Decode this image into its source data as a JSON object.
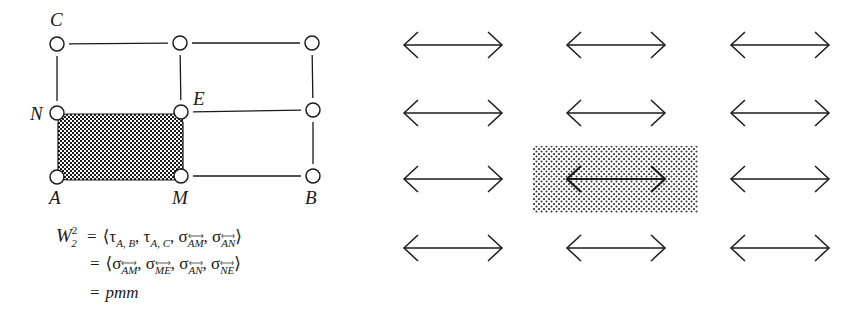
{
  "figure": {
    "left_diagram": {
      "nodes": [
        {
          "id": "C",
          "label": "C",
          "x": 57,
          "y": 44
        },
        {
          "id": "top-mid",
          "label": "",
          "x": 180,
          "y": 43
        },
        {
          "id": "top-right",
          "label": "",
          "x": 312,
          "y": 43
        },
        {
          "id": "N",
          "label": "N",
          "x": 57,
          "y": 113
        },
        {
          "id": "E",
          "label": "E",
          "x": 181,
          "y": 112
        },
        {
          "id": "mid-right",
          "label": "",
          "x": 313,
          "y": 110
        },
        {
          "id": "A",
          "label": "A",
          "x": 57,
          "y": 177
        },
        {
          "id": "M",
          "label": "M",
          "x": 181,
          "y": 176
        },
        {
          "id": "B",
          "label": "B",
          "x": 313,
          "y": 176
        }
      ],
      "edges": [
        [
          "C",
          "top-mid"
        ],
        [
          "top-mid",
          "top-right"
        ],
        [
          "C",
          "N"
        ],
        [
          "top-mid",
          "E"
        ],
        [
          "top-right",
          "mid-right"
        ],
        [
          "E",
          "mid-right"
        ],
        [
          "mid-right",
          "B"
        ],
        [
          "M",
          "B"
        ]
      ],
      "shaded_cell": {
        "x": 58,
        "y": 114,
        "width": 125,
        "height": 66,
        "corners": [
          "N",
          "E",
          "M",
          "A"
        ]
      },
      "labels": {
        "C": "C",
        "N": "N",
        "E": "E",
        "A": "A",
        "M": "M",
        "B": "B"
      }
    },
    "formula": {
      "lhs_script": "W",
      "lhs_sup": "2",
      "lhs_sub": "2",
      "line1": {
        "eq": "=",
        "open": "⟨",
        "terms": [
          {
            "sym": "τ",
            "sub": "A, B"
          },
          {
            "sym": "τ",
            "sub": "A, C"
          },
          {
            "sym": "σ",
            "sub": "AM",
            "line": true
          },
          {
            "sym": "σ",
            "sub": "AN",
            "line": true
          }
        ],
        "close": "⟩"
      },
      "line2": {
        "eq": "=",
        "open": "⟨",
        "terms": [
          {
            "sym": "σ",
            "sub": "AM",
            "line": true
          },
          {
            "sym": "σ",
            "sub": "ME",
            "line": true
          },
          {
            "sym": "σ",
            "sub": "AN",
            "line": true
          },
          {
            "sym": "σ",
            "sub": "NE",
            "line": true
          }
        ],
        "close": "⟩"
      },
      "line3": {
        "eq": "=",
        "value": "pmm"
      }
    },
    "right_diagram": {
      "arrow_type": "double-headed horizontal",
      "columns_x": [
        [
          404,
          502
        ],
        [
          567,
          665
        ],
        [
          731,
          829
        ]
      ],
      "rows_y": [
        45,
        113,
        179,
        248
      ],
      "highlight": {
        "row": 2,
        "col": 1,
        "x": 533,
        "y": 146,
        "width": 165,
        "height": 67
      }
    },
    "colors": {
      "ink": "#1a1a1a",
      "background": "#ffffff",
      "dark_shade": "#2a2a2a",
      "light_shade": "#9a9a9a"
    }
  }
}
